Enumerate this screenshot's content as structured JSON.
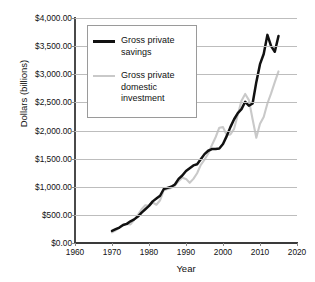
{
  "chart_data": {
    "type": "line",
    "title": "",
    "xlabel": "Year",
    "ylabel": "Dollars (billions)",
    "xlim": [
      1960,
      2020
    ],
    "ylim": [
      0,
      4000
    ],
    "xticks": [
      "1960",
      "1970",
      "1980",
      "1990",
      "2000",
      "2010",
      "2020"
    ],
    "yticks": [
      "$0.00",
      "$500.00",
      "$1,000.00",
      "$1,500.00",
      "$2,000.00",
      "$2,500.00",
      "$3,000.00",
      "$3,500.00",
      "$4,000.00"
    ],
    "ytick_values": [
      0,
      500,
      1000,
      1500,
      2000,
      2500,
      3000,
      3500,
      4000
    ],
    "xtick_values": [
      1960,
      1970,
      1980,
      1990,
      2000,
      2010,
      2020
    ],
    "grid": true,
    "legend_position": "upper-left-inside",
    "series": [
      {
        "name": "Gross private savings",
        "color": "#111111",
        "x": [
          1970,
          1971,
          1972,
          1973,
          1974,
          1975,
          1976,
          1977,
          1978,
          1979,
          1980,
          1981,
          1982,
          1983,
          1984,
          1985,
          1986,
          1987,
          1988,
          1989,
          1990,
          1991,
          1992,
          1993,
          1994,
          1995,
          1996,
          1997,
          1998,
          1999,
          2000,
          2001,
          2002,
          2003,
          2004,
          2005,
          2006,
          2007,
          2008,
          2009,
          2010,
          2011,
          2012,
          2013,
          2014,
          2015
        ],
        "values": [
          215,
          245,
          275,
          320,
          340,
          385,
          420,
          470,
          540,
          600,
          660,
          740,
          790,
          840,
          960,
          980,
          1000,
          1040,
          1140,
          1200,
          1280,
          1330,
          1380,
          1400,
          1490,
          1580,
          1640,
          1670,
          1670,
          1680,
          1760,
          1900,
          2060,
          2200,
          2310,
          2380,
          2510,
          2440,
          2480,
          2860,
          3180,
          3360,
          3700,
          3500,
          3400,
          3680
        ]
      },
      {
        "name": "Gross private domestic investment",
        "color": "#c9c9c9",
        "x": [
          1970,
          1971,
          1972,
          1973,
          1974,
          1975,
          1976,
          1977,
          1978,
          1979,
          1980,
          1981,
          1982,
          1983,
          1984,
          1985,
          1986,
          1987,
          1988,
          1989,
          1990,
          1991,
          1992,
          1993,
          1994,
          1995,
          1996,
          1997,
          1998,
          1999,
          2000,
          2001,
          2002,
          2003,
          2004,
          2005,
          2006,
          2007,
          2008,
          2009,
          2010,
          2011,
          2012,
          2013,
          2014,
          2015
        ],
        "values": [
          190,
          225,
          275,
          325,
          340,
          330,
          410,
          500,
          600,
          670,
          660,
          720,
          680,
          760,
          940,
          960,
          980,
          1020,
          1100,
          1160,
          1140,
          1070,
          1140,
          1240,
          1390,
          1480,
          1590,
          1740,
          1880,
          2050,
          2060,
          1920,
          1930,
          2030,
          2280,
          2530,
          2650,
          2540,
          2200,
          1870,
          2120,
          2240,
          2480,
          2660,
          2860,
          3050
        ]
      }
    ]
  },
  "legend": {
    "entries": [
      {
        "label": "Gross private savings",
        "swatch": "black"
      },
      {
        "label": "Gross private domestic investment",
        "swatch": "gray"
      }
    ]
  },
  "axes": {
    "y_title": "Dollars (billions)",
    "x_title": "Year"
  }
}
